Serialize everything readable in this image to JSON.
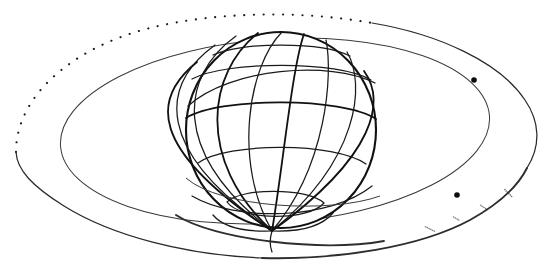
{
  "figure": {
    "kind": "astronomical-line-diagram",
    "width": 550,
    "height": 266,
    "background_color": "#ffffff",
    "ink_color": "#111111"
  },
  "globe": {
    "label": "globe",
    "center_x": 281,
    "center_y": 130,
    "radius_x": 95,
    "radius_y": 98,
    "limb_color": "#111111",
    "graticule_color": "#1a1a1a",
    "meridian_count": 12,
    "parallel_count": 5,
    "visible_pole": "south",
    "pole_x": 272,
    "pole_y": 231,
    "tilt_note": "viewed slightly from below; meridians converge at lower pole"
  },
  "rings": {
    "inner": {
      "label": "inner-orbit-ring",
      "center_x": 275,
      "center_y": 131,
      "radius_x": 215,
      "radius_y": 92,
      "rotation_deg": -4,
      "style": "solid-thin",
      "color": "#3a3a3a"
    },
    "outer": {
      "label": "outer-orbit-ring",
      "center_x": 275,
      "center_y": 128,
      "radius_x": 258,
      "radius_y": 115,
      "rotation_deg": -5,
      "upper_style": "dotted",
      "lower_style": "solid",
      "color": "#1b1b1b"
    }
  },
  "markers": [
    {
      "name": "satellite-marker-upper",
      "x": 474,
      "y": 80,
      "radius": 2.8,
      "color": "#0c0c0c"
    },
    {
      "name": "satellite-marker-lower",
      "x": 457,
      "y": 195,
      "radius": 2.8,
      "color": "#0c0c0c"
    }
  ],
  "ring_annotations": {
    "note": "faint illegible degraded markings along the lower-right arc of the outer ring",
    "glyph_runs": [
      {
        "text": "••••••",
        "x": 424,
        "y": 228,
        "rotation_deg": 26
      },
      {
        "text": "••••",
        "x": 452,
        "y": 218,
        "rotation_deg": 30
      },
      {
        "text": "•••••",
        "x": 479,
        "y": 206,
        "rotation_deg": 36
      },
      {
        "text": "••••••",
        "x": 503,
        "y": 190,
        "rotation_deg": 46
      }
    ]
  }
}
